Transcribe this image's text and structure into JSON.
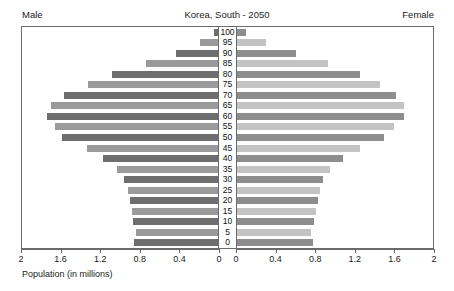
{
  "header": {
    "left_label": "Male",
    "title": "Korea, South - 2050",
    "right_label": "Female"
  },
  "axis": {
    "x_title": "Population (in millions)",
    "left_ticks": [
      "2",
      "1.6",
      "1.2",
      "0.8",
      "0.4",
      "0"
    ],
    "right_ticks": [
      "0",
      "0.4",
      "0.8",
      "1.2",
      "1.6",
      "2"
    ],
    "max": 2,
    "tick_step": 0.4
  },
  "colors": {
    "male_dark": "#6e6e6e",
    "male_light": "#9a9a9a",
    "female_dark": "#8d8d8d",
    "female_light": "#c3c3c3",
    "frame": "#6b6b6b",
    "background": "#ffffff"
  },
  "chart_data": {
    "type": "bar",
    "subtype": "population-pyramid",
    "title": "Korea, South - 2050",
    "xlabel": "Population (in millions)",
    "ylabel": "",
    "xlim": [
      0,
      2
    ],
    "grid": false,
    "legend": [
      "Male",
      "Female"
    ],
    "legend_position": "top-corners",
    "categories": [
      "100",
      "95",
      "90",
      "85",
      "80",
      "75",
      "70",
      "65",
      "60",
      "55",
      "50",
      "45",
      "40",
      "35",
      "30",
      "25",
      "20",
      "15",
      "10",
      "5",
      "0"
    ],
    "series": [
      {
        "name": "Male",
        "side": "left",
        "values": [
          0.04,
          0.18,
          0.43,
          0.73,
          1.08,
          1.33,
          1.57,
          1.7,
          1.74,
          1.66,
          1.59,
          1.34,
          1.17,
          1.03,
          0.96,
          0.92,
          0.9,
          0.88,
          0.87,
          0.84,
          0.86
        ]
      },
      {
        "name": "Female",
        "side": "right",
        "values": [
          0.09,
          0.3,
          0.6,
          0.93,
          1.26,
          1.46,
          1.62,
          1.7,
          1.7,
          1.6,
          1.5,
          1.25,
          1.08,
          0.95,
          0.88,
          0.85,
          0.83,
          0.81,
          0.79,
          0.76,
          0.78
        ]
      }
    ]
  }
}
